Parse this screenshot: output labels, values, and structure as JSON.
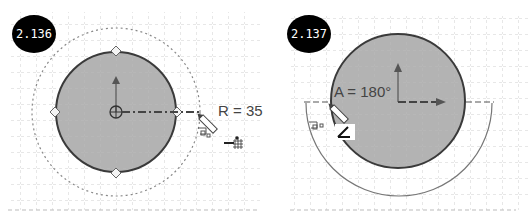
{
  "panels": [
    {
      "id": "fig-2-136",
      "badge": "2.136",
      "dimension_label": "R = 35",
      "tool_icons": [
        "pencil-icon",
        "trim-icon",
        "grid-snap-icon"
      ]
    },
    {
      "id": "fig-2-137",
      "badge": "2.137",
      "dimension_label": "A = 180°",
      "tool_icons": [
        "pencil-icon",
        "trim-icon",
        "angle-icon"
      ]
    }
  ],
  "colors": {
    "circle_fill": "#b3b3b3",
    "circle_stroke": "#3a3a3a",
    "grid": "#b8b8b8",
    "badge_bg": "#000000",
    "badge_text": "#ffffff",
    "guide": "#555555"
  }
}
